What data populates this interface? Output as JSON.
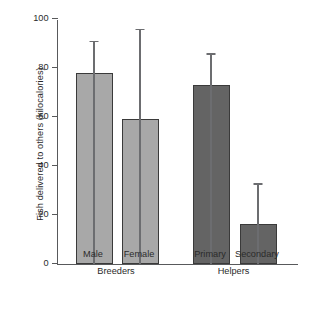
{
  "chart_data": {
    "type": "bar",
    "title": "",
    "xlabel": "",
    "ylabel": "Fish delivered to others (kilocalories)",
    "categories": [
      "Male",
      "Female",
      "Primary",
      "Secondary"
    ],
    "values": [
      78,
      59,
      73,
      16.5
    ],
    "errors_upper": [
      91,
      96,
      86,
      33
    ],
    "group_labels": [
      "Breeders",
      "Helpers"
    ],
    "group_spans": [
      [
        "Male",
        "Female"
      ],
      [
        "Primary",
        "Secondary"
      ]
    ],
    "ylim": [
      0,
      100
    ],
    "yticks": [
      0,
      20,
      40,
      60,
      80,
      100
    ],
    "ytick_labels": [
      "0",
      "20",
      "40",
      "60",
      "80",
      "100"
    ],
    "grid": false,
    "legend": "none",
    "bar_colors": [
      "#a8a8a8",
      "#a8a8a8",
      "#646464",
      "#646464"
    ],
    "bar_edge_color": "#3a3a3a",
    "error_bar_color": "#6c6d70",
    "axis_color": "#58595b",
    "background": "#ffffff",
    "bars": [
      {
        "label": "Male",
        "value": 78,
        "error_top": 91,
        "color": "#a8a8a8",
        "group": "Breeders"
      },
      {
        "label": "Female",
        "value": 59,
        "error_top": 96,
        "color": "#a8a8a8",
        "group": "Breeders"
      },
      {
        "label": "Primary",
        "value": 73,
        "error_top": 86,
        "color": "#646464",
        "group": "Helpers"
      },
      {
        "label": "Secondary",
        "value": 16.5,
        "error_top": 33,
        "color": "#646464",
        "group": "Helpers"
      }
    ]
  }
}
